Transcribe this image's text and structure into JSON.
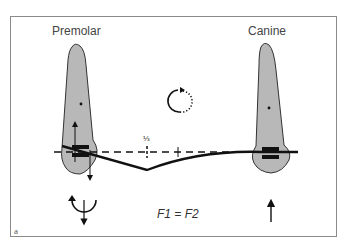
{
  "diagram": {
    "labels": {
      "left_tooth": "Premolar",
      "right_tooth": "Canine",
      "ratio_marker": "⅓",
      "force_equation": "F1 = F2",
      "panel_letter": "a"
    },
    "icons": {
      "rotation_indicator": "dotted-circular-arrow",
      "premolar_moment": "curved-arrow-with-down-arrow",
      "canine_force": "up-arrow"
    },
    "colors": {
      "tooth_fill": "#b8b8b8",
      "tooth_outline": "#333333",
      "wire": "#111111",
      "frame": "#8a8a8a"
    }
  }
}
